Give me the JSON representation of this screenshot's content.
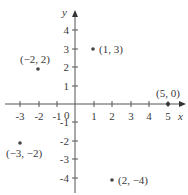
{
  "diagram": {
    "type": "coordinate-plane",
    "axis_labels": {
      "x": "x",
      "y": "y"
    },
    "origin_label": "0",
    "x_ticks": [
      "-3",
      "-2",
      "-1",
      "1",
      "2",
      "3",
      "4",
      "5"
    ],
    "y_ticks": [
      "4",
      "3",
      "2",
      "1",
      "-1",
      "-2",
      "-3",
      "-4"
    ],
    "points": [
      {
        "label": "(1, 3)",
        "x": 1,
        "y": 3
      },
      {
        "label": "(−2, 2)",
        "x": -2,
        "y": 2
      },
      {
        "label": "(5, 0)",
        "x": 5,
        "y": 0
      },
      {
        "label": "(−3, −2)",
        "x": -3,
        "y": -2
      },
      {
        "label": "(2, −4)",
        "x": 2,
        "y": -4
      }
    ]
  }
}
